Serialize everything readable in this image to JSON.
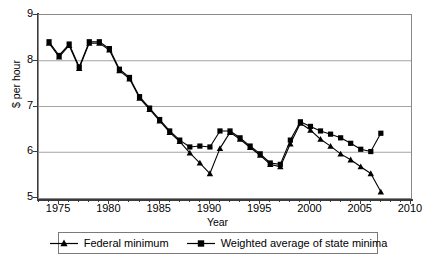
{
  "chart_data": {
    "type": "line",
    "title": "",
    "xlabel": "Year",
    "ylabel": "$ per hour",
    "xlim": [
      1973,
      2010
    ],
    "ylim": [
      5,
      9
    ],
    "grid": "horizontal",
    "legend_position": "bottom",
    "y_ticks": [
      5,
      6,
      7,
      8,
      9
    ],
    "x_ticks": [
      1975,
      1980,
      1985,
      1990,
      1995,
      2000,
      2005,
      2010
    ],
    "x_minor_tick_interval": 1,
    "x": [
      1974,
      1975,
      1976,
      1977,
      1978,
      1979,
      1980,
      1981,
      1982,
      1983,
      1984,
      1985,
      1986,
      1987,
      1988,
      1989,
      1990,
      1991,
      1992,
      1993,
      1994,
      1995,
      1996,
      1997,
      1998,
      1999,
      2000,
      2001,
      2002,
      2003,
      2004,
      2005,
      2006,
      2007
    ],
    "series": [
      {
        "name": "Federal minimum",
        "marker": "triangle",
        "values": [
          8.4,
          8.1,
          8.35,
          7.85,
          8.4,
          8.4,
          8.25,
          7.8,
          7.62,
          7.2,
          6.95,
          6.7,
          6.45,
          6.25,
          6.0,
          5.78,
          5.55,
          6.1,
          6.45,
          6.3,
          6.12,
          5.95,
          5.75,
          5.7,
          6.2,
          6.65,
          6.5,
          6.3,
          6.15,
          5.98,
          5.85,
          5.7,
          5.55,
          5.4
        ],
        "note_low": 5.15,
        "last_x": 2007,
        "last_value": 5.15
      },
      {
        "name": "Weighted average of state minima",
        "marker": "square",
        "values": [
          8.4,
          8.1,
          8.35,
          7.85,
          8.4,
          8.4,
          8.25,
          7.8,
          7.62,
          7.2,
          6.95,
          6.7,
          6.45,
          6.25,
          6.1,
          6.12,
          6.1,
          6.45,
          6.45,
          6.3,
          6.12,
          5.95,
          5.75,
          5.72,
          6.25,
          6.65,
          6.55,
          6.45,
          6.38,
          6.3,
          6.18,
          6.05,
          6.0,
          6.4
        ]
      }
    ]
  },
  "axis": {
    "y_label": "$ per hour",
    "x_label": "Year",
    "y_tick_labels": [
      "5",
      "6",
      "7",
      "8",
      "9"
    ],
    "x_tick_labels": [
      "1975",
      "1980",
      "1985",
      "1990",
      "1995",
      "2000",
      "2005",
      "2010"
    ]
  },
  "legend": {
    "items": [
      {
        "label": "Federal minimum",
        "marker": "triangle-marker"
      },
      {
        "label": "Weighted average of state minima",
        "marker": "square-marker"
      }
    ]
  },
  "colors": {
    "line": "#000000",
    "grid": "#9a9a9a",
    "axis": "#3a3a3a",
    "background": "#ffffff"
  }
}
